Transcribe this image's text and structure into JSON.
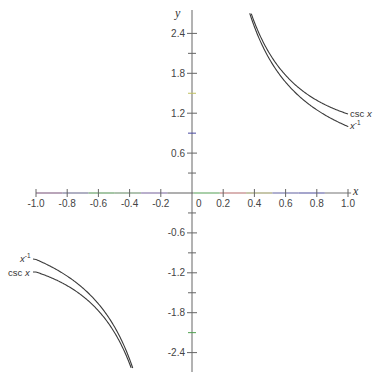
{
  "chart_data": {
    "type": "line",
    "title": "",
    "xlabel": "x",
    "ylabel": "y",
    "xlim": [
      -1.0,
      1.0
    ],
    "ylim": [
      -2.6,
      2.65
    ],
    "grid": false,
    "x_ticks": [
      -1.0,
      -0.8,
      -0.6,
      -0.4,
      -0.2,
      0,
      0.2,
      0.4,
      0.6,
      0.8,
      1.0
    ],
    "x_tick_labels": [
      "-1.0",
      "-0.8",
      "-0.6",
      "-0.4",
      "-0.2",
      "0",
      "0.2",
      "0.4",
      "0.6",
      "0.8",
      "1.0"
    ],
    "y_ticks_labeled": [
      2.4,
      1.8,
      1.2,
      0.6,
      -0.6,
      -1.2,
      -1.8,
      -2.4
    ],
    "y_tick_labels": [
      "2.4",
      "1.8",
      "1.2",
      "0.6",
      "-0.6",
      "-1.2",
      "-1.8",
      "-2.4"
    ],
    "y_ticks_minor": [
      2.1,
      1.5,
      0.9,
      0.3,
      -0.3,
      -0.9,
      -1.5,
      -2.1
    ],
    "series": [
      {
        "name": "csc x",
        "function": "1/sin(x)",
        "label_right": "csc x",
        "label_left": "csc x",
        "x": [
          0.38,
          0.4,
          0.5,
          0.6,
          0.7,
          0.8,
          0.9,
          1.0
        ],
        "y": [
          2.7,
          2.57,
          2.09,
          1.77,
          1.55,
          1.39,
          1.28,
          1.19
        ]
      },
      {
        "name": "x^-1",
        "function": "1/x",
        "label_right": "x⁻¹",
        "label_left": "x⁻¹",
        "x": [
          0.37,
          0.4,
          0.5,
          0.6,
          0.7,
          0.8,
          0.9,
          1.0
        ],
        "y": [
          2.7,
          2.5,
          2.0,
          1.67,
          1.43,
          1.25,
          1.11,
          1.0
        ]
      }
    ],
    "legend": "inline labels at curve ends",
    "colors": {
      "curves": "#3a3a3a",
      "axes": "#555555",
      "background": "#ffffff"
    }
  },
  "labels": {
    "x_axis": "x",
    "y_axis": "y",
    "csc_right": "csc",
    "csc_var": "x",
    "inv_right_base": "x",
    "inv_right_exp": "-1",
    "csc_left": "csc",
    "csc_left_var": "x",
    "inv_left_base": "x",
    "inv_left_exp": "-1"
  }
}
